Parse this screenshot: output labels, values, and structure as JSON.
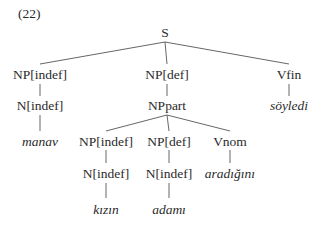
{
  "example_number": "(22)",
  "tree": {
    "root": "S",
    "nodes": {
      "s": "S",
      "np_indef": "NP[indef]",
      "np_def": "NP[def]",
      "vfin": "Vfin",
      "n_indef_1": "N[indef]",
      "np_part": "NPpart",
      "soyledi": "söyledi",
      "manav": "manav",
      "np_indef_2": "NP[indef]",
      "np_def_2": "NP[def]",
      "vnom": "Vnom",
      "n_indef_2": "N[indef]",
      "n_indef_3": "N[indef]",
      "aradigini": "aradığını",
      "kizin": "kızın",
      "adami": "adamı"
    }
  }
}
